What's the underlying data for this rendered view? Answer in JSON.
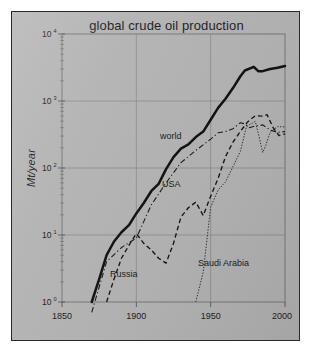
{
  "figure": {
    "title": "global crude oil production",
    "ylabel": "Mt/year",
    "background_color": "#b3b3b3",
    "border_color": "#2a2a2a"
  },
  "axes": {
    "y_tick_labels": [
      "10",
      "10",
      "10",
      "10",
      "10"
    ],
    "y_tick_exponents": [
      "0",
      "1",
      "2",
      "3",
      "4"
    ],
    "x_tick_labels": [
      "1850",
      "1900",
      "1950",
      "2000"
    ]
  },
  "series_labels": {
    "world": "world",
    "usa": "USA",
    "russia": "Russia",
    "saudi_arabia": "Saudi Arabia"
  },
  "chart_data": {
    "type": "line",
    "title": "global crude oil production",
    "xlabel": "",
    "ylabel": "Mt/year",
    "xlim": [
      1850,
      2000
    ],
    "ylim": [
      1,
      10000
    ],
    "yscale": "log",
    "grid": true,
    "gridlines_x": [
      1900,
      1950
    ],
    "gridlines_y": [
      10,
      100,
      1000
    ],
    "legend": "inline-annotations",
    "x_ticks": [
      1850,
      1900,
      1950,
      2000
    ],
    "y_ticks": [
      1,
      10,
      100,
      1000,
      10000
    ],
    "series": [
      {
        "name": "world",
        "style": "solid-thick",
        "x": [
          1870,
          1875,
          1880,
          1885,
          1890,
          1895,
          1900,
          1905,
          1910,
          1915,
          1920,
          1925,
          1930,
          1935,
          1940,
          1945,
          1950,
          1955,
          1960,
          1965,
          1970,
          1973,
          1979,
          1982,
          1985,
          1990,
          1995,
          2000
        ],
        "values": [
          1.0,
          2.2,
          5.0,
          8.0,
          11.0,
          14.0,
          21.0,
          30.0,
          45.0,
          58.0,
          96.0,
          145.0,
          195.0,
          225.0,
          290.0,
          350.0,
          525.0,
          790.0,
          1080.0,
          1560.0,
          2340.0,
          2850.0,
          3230.0,
          2790.0,
          2790.0,
          3000.0,
          3130.0,
          3330.0
        ]
      },
      {
        "name": "USA",
        "style": "dash-dot",
        "x": [
          1870,
          1880,
          1890,
          1900,
          1910,
          1920,
          1930,
          1940,
          1950,
          1955,
          1960,
          1965,
          1970,
          1973,
          1976,
          1980,
          1985,
          1990,
          1995,
          2000
        ],
        "values": [
          0.7,
          4.0,
          6.5,
          9.0,
          28.0,
          60.0,
          120.0,
          183.0,
          270.0,
          335.0,
          350.0,
          385.0,
          475.0,
          455.0,
          400.0,
          425.0,
          440.0,
          370.0,
          340.0,
          350.0
        ]
      },
      {
        "name": "Russia",
        "style": "dashed",
        "x": [
          1880,
          1885,
          1890,
          1895,
          1900,
          1905,
          1910,
          1915,
          1920,
          1925,
          1930,
          1935,
          1940,
          1945,
          1950,
          1955,
          1960,
          1965,
          1970,
          1975,
          1980,
          1985,
          1988,
          1992,
          1996,
          2000
        ],
        "values": [
          1.0,
          2.2,
          4.5,
          7.0,
          10.5,
          7.5,
          6.0,
          4.5,
          3.8,
          7.5,
          18.5,
          25.5,
          31.0,
          19.5,
          38.0,
          70.0,
          148.0,
          243.0,
          353.0,
          491.0,
          603.0,
          595.0,
          624.0,
          400.0,
          305.0,
          323.0
        ]
      },
      {
        "name": "Saudi Arabia",
        "style": "dotted",
        "x": [
          1940,
          1945,
          1950,
          1955,
          1960,
          1965,
          1970,
          1974,
          1977,
          1980,
          1982,
          1985,
          1987,
          1990,
          1995,
          2000
        ],
        "values": [
          1.0,
          2.8,
          26.0,
          47.0,
          62.0,
          105.0,
          177.0,
          412.0,
          455.0,
          496.0,
          330.0,
          170.0,
          215.0,
          342.0,
          415.0,
          410.0
        ]
      }
    ]
  }
}
